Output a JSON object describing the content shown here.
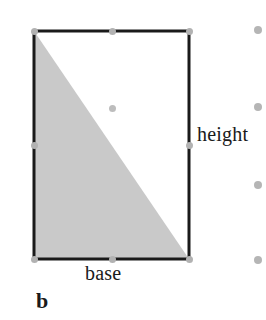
{
  "figure": {
    "panel_label": "b",
    "caption_labels": {
      "height": "height",
      "base": "base"
    },
    "colors": {
      "outline": "#1a1a1a",
      "shaded_region": "#c9c9c9",
      "page_background": "#ffffff",
      "handle": "#b2b2b2",
      "center_handle": "#bdbdbd",
      "margin_dot": "#b5b5b5",
      "text": "#1a1a1a"
    },
    "shape": {
      "type": "rectangle",
      "stroke_width": 3,
      "x": 34,
      "y": 31,
      "width": 155,
      "height": 228
    },
    "shaded_triangle": {
      "type": "polygon",
      "description": "half-of-rectangle triangle",
      "points": "34,31 34,259 189,259",
      "fill": "#c9c9c9"
    },
    "selection_handles": [
      {
        "name": "handle-top-left",
        "x": 34,
        "y": 31
      },
      {
        "name": "handle-top-center",
        "x": 112,
        "y": 31
      },
      {
        "name": "handle-top-right",
        "x": 189,
        "y": 31
      },
      {
        "name": "handle-middle-left",
        "x": 34,
        "y": 145
      },
      {
        "name": "handle-center",
        "x": 112,
        "y": 108
      },
      {
        "name": "handle-middle-right",
        "x": 189,
        "y": 145
      },
      {
        "name": "handle-bottom-left",
        "x": 34,
        "y": 259
      },
      {
        "name": "handle-bottom-center",
        "x": 112,
        "y": 259
      },
      {
        "name": "handle-bottom-right",
        "x": 189,
        "y": 259
      }
    ],
    "margin_dots": [
      {
        "name": "margin-dot-1",
        "x": 258,
        "y": 30
      },
      {
        "name": "margin-dot-2",
        "x": 258,
        "y": 107
      },
      {
        "name": "margin-dot-3",
        "x": 258,
        "y": 185
      },
      {
        "name": "margin-dot-4",
        "x": 258,
        "y": 260
      }
    ]
  }
}
